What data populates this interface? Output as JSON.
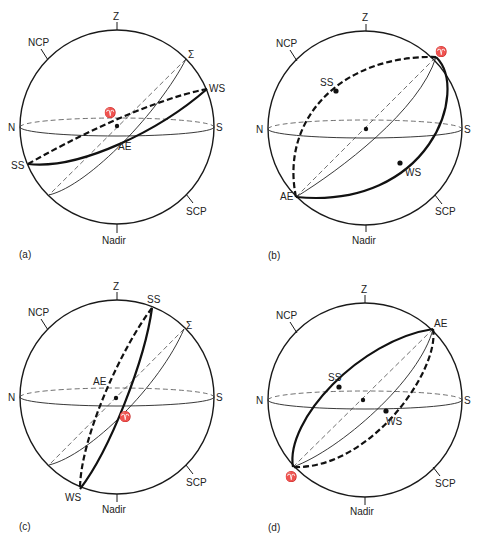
{
  "figure": {
    "common_labels": {
      "zenith": "Z",
      "nadir": "Nadir",
      "north_celestial_pole": "NCP",
      "south_celestial_pole": "SCP",
      "north": "N",
      "south": "S"
    },
    "panels": [
      {
        "id": "a",
        "caption": "(a)",
        "labels": {
          "sigma": "Σ",
          "ws": "WS",
          "aries": "♈",
          "ae": "AE",
          "ss": "SS"
        }
      },
      {
        "id": "b",
        "caption": "(b)",
        "labels": {
          "aries": "♈",
          "ss": "SS",
          "ws": "WS",
          "ae": "AE"
        }
      },
      {
        "id": "c",
        "caption": "(c)",
        "labels": {
          "ss": "SS",
          "sigma": "Σ",
          "ae": "AE",
          "aries": "♈",
          "ws": "WS"
        }
      },
      {
        "id": "d",
        "caption": "(d)",
        "labels": {
          "ae": "AE",
          "ss": "SS",
          "ws": "WS",
          "aries": "♈"
        }
      }
    ]
  },
  "colors": {
    "line": "#111111",
    "background": "#ffffff"
  }
}
